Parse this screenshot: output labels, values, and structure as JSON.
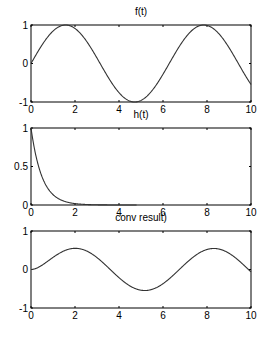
{
  "chart_data": [
    {
      "type": "line",
      "title": "f(t)",
      "function": "sin(t)",
      "x_range": [
        0,
        10
      ],
      "xlim": [
        0,
        10
      ],
      "ylim": [
        -1,
        1
      ],
      "xticks": [
        0,
        2,
        4,
        6,
        8,
        10
      ],
      "yticks": [
        -1,
        0,
        1
      ],
      "xtick_labels": [
        "0",
        "2",
        "4",
        "6",
        "8",
        "10"
      ],
      "ytick_labels": [
        "-1",
        "0",
        "1"
      ],
      "series": [
        {
          "name": "f(t)",
          "x": [
            0,
            1,
            1.57,
            2,
            3,
            4,
            4.71,
            5,
            6,
            7,
            7.85,
            8,
            9,
            10
          ],
          "values": [
            0,
            0.84,
            1,
            0.91,
            0.14,
            -0.76,
            -1,
            -0.96,
            -0.28,
            0.66,
            1,
            0.99,
            0.41,
            -0.54
          ]
        }
      ]
    },
    {
      "type": "line",
      "title": "h(t)",
      "function": "exp(-2t)",
      "x_range": [
        0,
        4.8
      ],
      "xlim": [
        0,
        10
      ],
      "ylim": [
        0,
        1
      ],
      "xticks": [
        0,
        2,
        4,
        6,
        8,
        10
      ],
      "yticks": [
        0,
        0.5,
        1
      ],
      "xtick_labels": [
        "0",
        "2",
        "4",
        "6",
        "8",
        "10"
      ],
      "ytick_labels": [
        "0",
        "0.5",
        "1"
      ],
      "series": [
        {
          "name": "h(t)",
          "x": [
            0,
            0.35,
            0.5,
            1,
            1.5,
            2,
            3,
            4,
            4.8
          ],
          "values": [
            1,
            0.5,
            0.37,
            0.14,
            0.05,
            0.02,
            0.0,
            0.0,
            0.0
          ]
        }
      ]
    },
    {
      "type": "line",
      "title": "conv result)",
      "function": "conv(f,h)",
      "x_range": [
        0,
        10
      ],
      "xlim": [
        0,
        10
      ],
      "ylim": [
        -1,
        1
      ],
      "peak": 0.55,
      "xticks": [
        0,
        2,
        4,
        6,
        8,
        10
      ],
      "yticks": [
        -1,
        0,
        1
      ],
      "xtick_labels": [
        "0",
        "2",
        "4",
        "6",
        "8",
        "10"
      ],
      "ytick_labels": [
        "-1",
        "0",
        "1"
      ],
      "series": [
        {
          "name": "conv result",
          "x": [
            0,
            1,
            2.1,
            3,
            4,
            5.3,
            6,
            7,
            8.5,
            9,
            10
          ],
          "values": [
            0,
            0.27,
            0.55,
            0.42,
            0.0,
            -0.55,
            -0.45,
            -0.05,
            0.55,
            0.49,
            0.02
          ]
        }
      ]
    }
  ]
}
